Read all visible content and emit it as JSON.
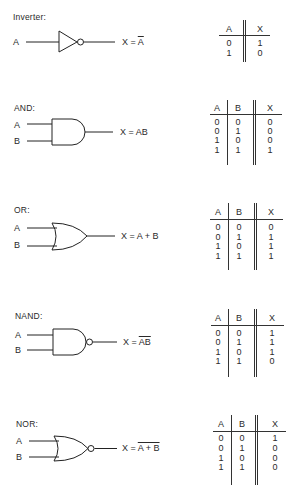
{
  "gates": [
    {
      "name": "Inverter",
      "label": "Inverter:",
      "inputs": [
        "A"
      ],
      "expression": {
        "prefix": "X = ",
        "overlined": "A",
        "plain": ""
      },
      "truth_table": {
        "headers": [
          "A",
          "X"
        ],
        "rows": [
          [
            "0",
            "1"
          ],
          [
            "1",
            "0"
          ]
        ]
      }
    },
    {
      "name": "AND",
      "label": "AND:",
      "inputs": [
        "A",
        "B"
      ],
      "expression": {
        "prefix": "X = ",
        "overlined": "",
        "plain": "AB"
      },
      "truth_table": {
        "headers": [
          "A",
          "B",
          "X"
        ],
        "rows": [
          [
            "0",
            "0",
            "0"
          ],
          [
            "0",
            "1",
            "0"
          ],
          [
            "1",
            "0",
            "0"
          ],
          [
            "1",
            "1",
            "1"
          ]
        ]
      }
    },
    {
      "name": "OR",
      "label": "OR:",
      "inputs": [
        "A",
        "B"
      ],
      "expression": {
        "prefix": "X = ",
        "overlined": "",
        "plain": "A + B"
      },
      "truth_table": {
        "headers": [
          "A",
          "B",
          "X"
        ],
        "rows": [
          [
            "0",
            "0",
            "0"
          ],
          [
            "0",
            "1",
            "1"
          ],
          [
            "1",
            "0",
            "1"
          ],
          [
            "1",
            "1",
            "1"
          ]
        ]
      }
    },
    {
      "name": "NAND",
      "label": "NAND:",
      "inputs": [
        "A",
        "B"
      ],
      "expression": {
        "prefix": "X = ",
        "overlined": "AB",
        "plain": ""
      },
      "truth_table": {
        "headers": [
          "A",
          "B",
          "X"
        ],
        "rows": [
          [
            "0",
            "0",
            "1"
          ],
          [
            "0",
            "1",
            "1"
          ],
          [
            "1",
            "0",
            "1"
          ],
          [
            "1",
            "1",
            "0"
          ]
        ]
      }
    },
    {
      "name": "NOR",
      "label": "NOR:",
      "inputs": [
        "A",
        "B"
      ],
      "expression": {
        "prefix": "X = ",
        "overlined": "A + B",
        "plain": ""
      },
      "truth_table": {
        "headers": [
          "A",
          "B",
          "X"
        ],
        "rows": [
          [
            "0",
            "0",
            "1"
          ],
          [
            "0",
            "1",
            "0"
          ],
          [
            "1",
            "0",
            "0"
          ],
          [
            "1",
            "1",
            "0"
          ]
        ]
      }
    }
  ]
}
